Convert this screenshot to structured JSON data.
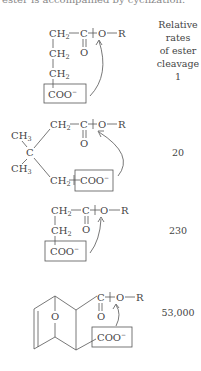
{
  "caption_cutoff": "ester is accompanied by cyclization.",
  "header": {
    "line1": "Relative",
    "line2": "rates",
    "line3": "of ester",
    "line4": "cleavage"
  },
  "compounds": [
    {
      "name": "4-carboxybutanoate ester (linear chain)",
      "rate": "1",
      "atoms": [
        "CH2",
        "C",
        "O",
        "O",
        "R",
        "CH2",
        "CH2",
        "COO-"
      ]
    },
    {
      "name": "3,3-dimethylglutarate ester",
      "rate": "20",
      "atoms": [
        "CH3",
        "CH3",
        "C",
        "CH2",
        "C",
        "O",
        "O",
        "R",
        "CH2",
        "COO-"
      ]
    },
    {
      "name": "succinate ester",
      "rate": "230",
      "atoms": [
        "CH2",
        "C",
        "O",
        "O",
        "R",
        "CH2",
        "COO-"
      ]
    },
    {
      "name": "bicyclic oxa-bridged ester",
      "rate": "53,000",
      "atoms": [
        "O",
        "C",
        "O",
        "O",
        "R",
        "COO-"
      ]
    }
  ],
  "labels": {
    "CH": "CH",
    "C": "C",
    "O": "O",
    "R": "R",
    "COO": "COO",
    "minus": "−",
    "two": "2",
    "three": "3"
  },
  "colors": {
    "ink": "#444444",
    "background": "#ffffff"
  }
}
